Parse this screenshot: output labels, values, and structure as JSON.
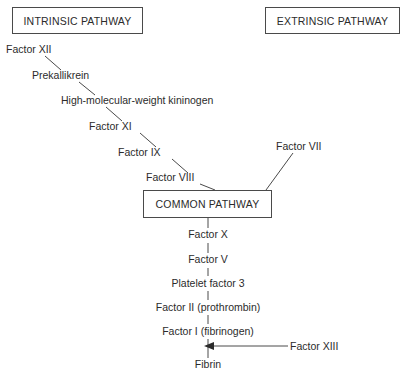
{
  "diagram": {
    "line_color": "#4a4a4a",
    "text_color": "#2b2b2b",
    "background": "#ffffff"
  },
  "headers": {
    "intrinsic": "INTRINSIC PATHWAY",
    "extrinsic": "EXTRINSIC PATHWAY"
  },
  "common_box": {
    "label": "COMMON PATHWAY"
  },
  "intrinsic_chain": [
    {
      "label": "Factor XII"
    },
    {
      "label": "Prekallikrein"
    },
    {
      "label": "High-molecular-weight kininogen"
    },
    {
      "label": "Factor XI"
    },
    {
      "label": "Factor IX"
    },
    {
      "label": "Factor VIII"
    }
  ],
  "extrinsic_chain": [
    {
      "label": "Factor VII"
    }
  ],
  "common_chain": [
    {
      "label": "Factor X"
    },
    {
      "label": "Factor V"
    },
    {
      "label": "Platelet factor 3"
    },
    {
      "label": "Factor II (prothrombin)"
    },
    {
      "label": "Factor I (fibrinogen)"
    },
    {
      "label": "Fibrin"
    }
  ],
  "cofactors": [
    {
      "label": "Factor XIII"
    }
  ],
  "caption": ""
}
